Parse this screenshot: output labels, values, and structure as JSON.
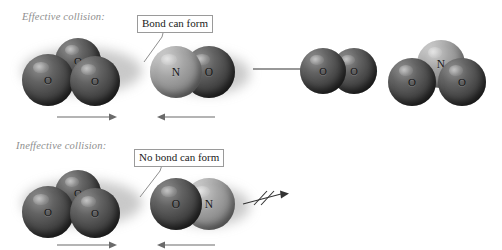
{
  "figure": {
    "type": "reaction-orientation-diagram"
  },
  "rows": [
    {
      "id": "effective",
      "heading": "Effective collision:",
      "callout": "Bond can form",
      "reactants": [
        {
          "name": "ozone",
          "formula": "O3",
          "atoms": [
            {
              "symbol": "O",
              "shade": "dark"
            },
            {
              "symbol": "O",
              "shade": "dark"
            },
            {
              "symbol": "O",
              "shade": "dark"
            }
          ],
          "motion": "right"
        },
        {
          "name": "nitrogen-monoxide",
          "formula": "NO",
          "atoms": [
            {
              "symbol": "N",
              "shade": "light"
            },
            {
              "symbol": "O",
              "shade": "dark"
            }
          ],
          "motion": "left"
        }
      ],
      "reaction_arrow": "proceeds",
      "products": [
        {
          "name": "dioxygen",
          "formula": "O2",
          "atoms": [
            {
              "symbol": "O",
              "shade": "dark"
            },
            {
              "symbol": "O",
              "shade": "dark"
            }
          ]
        },
        {
          "name": "nitrogen-dioxide",
          "formula": "NO2",
          "atoms": [
            {
              "symbol": "N",
              "shade": "light"
            },
            {
              "symbol": "O",
              "shade": "dark"
            },
            {
              "symbol": "O",
              "shade": "dark"
            }
          ]
        }
      ],
      "operator": "+"
    },
    {
      "id": "ineffective",
      "heading": "Ineffective collision:",
      "callout": "No bond can form",
      "reactants": [
        {
          "name": "ozone",
          "formula": "O3",
          "atoms": [
            {
              "symbol": "O",
              "shade": "dark"
            },
            {
              "symbol": "O",
              "shade": "dark"
            },
            {
              "symbol": "O",
              "shade": "dark"
            }
          ],
          "motion": "right"
        },
        {
          "name": "nitrogen-monoxide-flipped",
          "formula": "ON",
          "atoms": [
            {
              "symbol": "O",
              "shade": "dark"
            },
            {
              "symbol": "N",
              "shade": "light"
            }
          ],
          "motion": "left"
        }
      ],
      "reaction_arrow": "blocked",
      "products": [],
      "operator": ""
    }
  ],
  "colors": {
    "atom_dark": "#4e4e4e",
    "atom_light": "#a6a6a6",
    "heading_text": "#8e8e8e",
    "callout_border": "#9a9a9a",
    "arrow": "#4a4a4a",
    "background": "#ffffff"
  },
  "labels": {
    "atom_o": "O",
    "atom_n": "N",
    "plus": "+"
  }
}
